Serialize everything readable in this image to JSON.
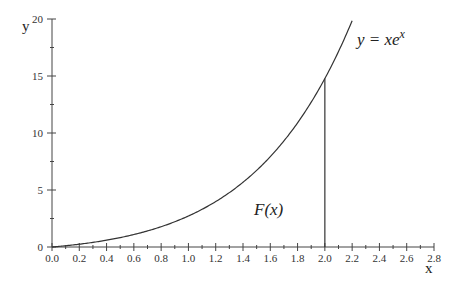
{
  "chart_data": {
    "type": "line",
    "title": "",
    "xlabel": "x",
    "ylabel": "y",
    "xlim": [
      0.0,
      2.8
    ],
    "ylim": [
      0,
      20
    ],
    "x_ticks": [
      "0.0",
      "0.2",
      "0.4",
      "0.6",
      "0.8",
      "1.0",
      "1.2",
      "1.4",
      "1.6",
      "1.8",
      "2.0",
      "2.2",
      "2.4",
      "2.6",
      "2.8"
    ],
    "y_ticks": [
      "0",
      "5",
      "10",
      "15",
      "20"
    ],
    "grid": false,
    "series": [
      {
        "name": "y = xe^x",
        "x": [
          0.0,
          0.2,
          0.4,
          0.6,
          0.8,
          1.0,
          1.2,
          1.4,
          1.6,
          1.8,
          2.0,
          2.2
        ],
        "values": [
          0.0,
          0.24,
          0.6,
          1.09,
          1.78,
          2.72,
          3.98,
          5.68,
          7.92,
          10.89,
          14.78,
          19.85
        ]
      }
    ],
    "annotations": [
      {
        "text": "y = xe",
        "superscript": "x",
        "position": "upper right of curve"
      },
      {
        "text": "F(x)",
        "position": "area under curve near x=1.65, y=3"
      },
      {
        "type": "vertical-line",
        "x": 2.0,
        "from_y": 0,
        "to_y": 14.78
      }
    ]
  },
  "labels": {
    "x_axis": "x",
    "y_axis": "y",
    "curve_label_main": "y = xe",
    "curve_label_sup": "x",
    "area_label": "F(x)"
  }
}
